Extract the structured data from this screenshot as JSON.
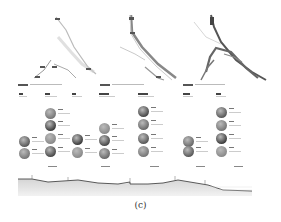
{
  "figure": {
    "caption": "(c)",
    "panels": [
      {
        "id": "map-1",
        "caption_text": "",
        "columns": 3
      },
      {
        "id": "map-2",
        "caption_text": "",
        "columns": 2
      },
      {
        "id": "map-3",
        "caption_text": "",
        "columns": 2
      }
    ],
    "photo_columns": [
      {
        "x": 19,
        "photos_y": [
          136,
          148
        ]
      },
      {
        "x": 45,
        "photos_y": [
          108,
          120,
          133,
          146
        ]
      },
      {
        "x": 72,
        "photos_y": [
          134,
          147
        ]
      },
      {
        "x": 99,
        "photos_y": [
          123,
          135,
          148
        ]
      },
      {
        "x": 138,
        "photos_y": [
          106,
          119,
          133,
          146
        ]
      },
      {
        "x": 183,
        "photos_y": [
          136,
          146
        ]
      },
      {
        "x": 216,
        "photos_y": [
          107,
          120,
          133,
          146
        ]
      }
    ],
    "profile": {
      "type": "terrain-cross-section",
      "colors": {
        "line": "#333333",
        "fill_top": "#d9d9d9",
        "fill_bottom": "#eeeeee"
      }
    }
  }
}
